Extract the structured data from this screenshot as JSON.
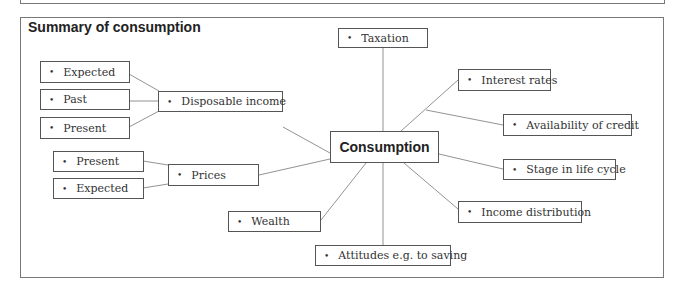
{
  "title": "Summary of consumption",
  "center": "Consumption",
  "nodes": {
    "taxation": "Taxation",
    "interest_rates": "Interest rates",
    "availability_credit": "Availability of credit",
    "stage_life_cycle": "Stage in life cycle",
    "income_distribution": "Income distribution",
    "attitudes": "Attitudes e.g. to saving",
    "wealth": "Wealth",
    "prices": "Prices",
    "prices_present": "Present",
    "prices_expected": "Expected",
    "disposable_income": "Disposable income",
    "di_expected": "Expected",
    "di_past": "Past",
    "di_present": "Present"
  },
  "bullet": "•"
}
